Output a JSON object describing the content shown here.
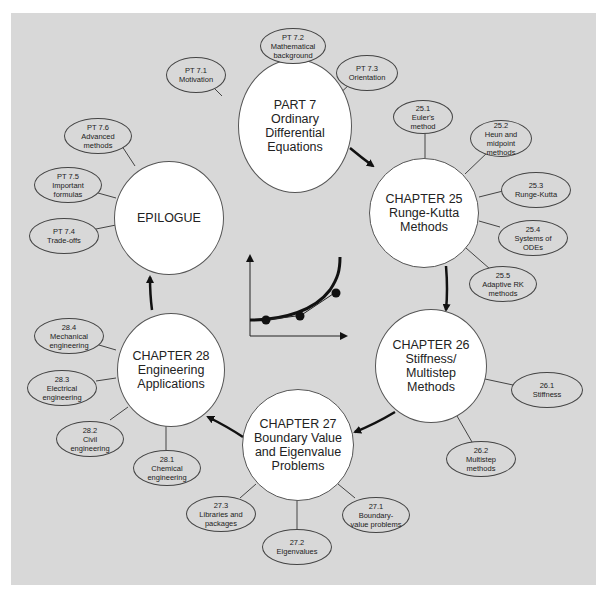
{
  "diagram": {
    "type": "concept-map",
    "flow_order": [
      "part7",
      "ch25",
      "ch26",
      "ch27",
      "ch28",
      "epilogue"
    ],
    "center_figure": {
      "label": "ODE solution curve with numerical step points",
      "points": 3
    }
  },
  "nodes": {
    "part7": {
      "lines": [
        "PART 7",
        "Ordinary",
        "Differential",
        "Equations"
      ],
      "children": [
        {
          "lines": [
            "PT 7.1",
            "Motivation"
          ]
        },
        {
          "lines": [
            "PT 7.2",
            "Mathematical",
            "background"
          ]
        },
        {
          "lines": [
            "PT 7.3",
            "Orientation"
          ]
        }
      ]
    },
    "ch25": {
      "lines": [
        "CHAPTER 25",
        "Runge-Kutta",
        "Methods"
      ],
      "children": [
        {
          "lines": [
            "25.1",
            "Euler's",
            "method"
          ]
        },
        {
          "lines": [
            "25.2",
            "Heun and",
            "midpoint",
            "methods"
          ]
        },
        {
          "lines": [
            "25.3",
            "Runge-Kutta"
          ]
        },
        {
          "lines": [
            "25.4",
            "Systems of",
            "ODEs"
          ]
        },
        {
          "lines": [
            "25.5",
            "Adaptive RK",
            "methods"
          ]
        }
      ]
    },
    "ch26": {
      "lines": [
        "CHAPTER 26",
        "Stiffness/",
        "Multistep",
        "Methods"
      ],
      "children": [
        {
          "lines": [
            "26.1",
            "Stiffness"
          ]
        },
        {
          "lines": [
            "26.2",
            "Multistep",
            "methods"
          ]
        }
      ]
    },
    "ch27": {
      "lines": [
        "CHAPTER 27",
        "Boundary Value",
        "and Eigenvalue",
        "Problems"
      ],
      "children": [
        {
          "lines": [
            "27.1",
            "Boundary-",
            "value problems"
          ]
        },
        {
          "lines": [
            "27.2",
            "Eigenvalues"
          ]
        },
        {
          "lines": [
            "27.3",
            "Libraries and",
            "packages"
          ]
        }
      ]
    },
    "ch28": {
      "lines": [
        "CHAPTER 28",
        "Engineering",
        "Applications"
      ],
      "children": [
        {
          "lines": [
            "28.1",
            "Chemical",
            "engineering"
          ]
        },
        {
          "lines": [
            "28.2",
            "Civil",
            "engineering"
          ]
        },
        {
          "lines": [
            "28.3",
            "Electrical",
            "engineering"
          ]
        },
        {
          "lines": [
            "28.4",
            "Mechanical",
            "engineering"
          ]
        }
      ]
    },
    "epilogue": {
      "lines": [
        "EPILOGUE"
      ],
      "children": [
        {
          "lines": [
            "PT 7.4",
            "Trade-offs"
          ]
        },
        {
          "lines": [
            "PT 7.5",
            "Important",
            "formulas"
          ]
        },
        {
          "lines": [
            "PT 7.6",
            "Advanced",
            "methods"
          ]
        }
      ]
    }
  },
  "colors": {
    "background": "#d8d8d8",
    "circle_fill": "#ffffff",
    "stroke": "#222222"
  }
}
